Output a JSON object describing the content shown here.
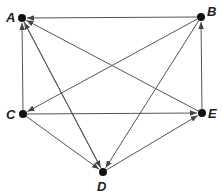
{
  "diagram": {
    "type": "directed-graph",
    "nodes": [
      {
        "id": "A",
        "label": "A",
        "x": 22,
        "y": 18,
        "lx": 6,
        "ly": 22
      },
      {
        "id": "B",
        "label": "B",
        "x": 201,
        "y": 17,
        "lx": 207,
        "ly": 16
      },
      {
        "id": "C",
        "label": "C",
        "x": 23,
        "y": 114,
        "lx": 6,
        "ly": 119
      },
      {
        "id": "D",
        "label": "D",
        "x": 103,
        "y": 172,
        "lx": 97,
        "ly": 191
      },
      {
        "id": "E",
        "label": "E",
        "x": 202,
        "y": 113,
        "lx": 208,
        "ly": 118
      }
    ],
    "edges": [
      {
        "from": "B",
        "to": "A"
      },
      {
        "from": "E",
        "to": "A"
      },
      {
        "from": "C",
        "to": "A"
      },
      {
        "from": "D",
        "to": "A"
      },
      {
        "from": "B",
        "to": "C"
      },
      {
        "from": "B",
        "to": "D"
      },
      {
        "from": "E",
        "to": "B"
      },
      {
        "from": "C",
        "to": "E"
      },
      {
        "from": "C",
        "to": "D"
      },
      {
        "from": "D",
        "to": "E"
      },
      {
        "from": "A",
        "to": "D"
      }
    ],
    "colors": {
      "edge": "#555555",
      "node": "#111111",
      "label": "#222222"
    }
  }
}
